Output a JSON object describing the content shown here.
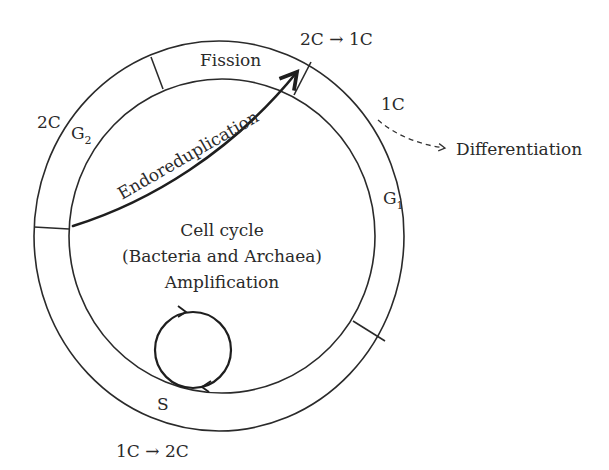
{
  "diagram": {
    "title": "Cell cycle (Bacteria and Archaea)",
    "center_labels": {
      "line1": "Cell cycle",
      "line2": "(Bacteria and Archaea)",
      "line3": "Amplification"
    },
    "phases": {
      "fission": "Fission",
      "g2_main": "G",
      "g2_sub": "2",
      "g1_main": "G",
      "g1_sub": "1",
      "s": "S"
    },
    "ploidy_labels": {
      "g2": "2C",
      "fission_transition": "2C → 1C",
      "g1": "1C",
      "s_transition": "1C → 2C"
    },
    "pathways": {
      "endoreduplication": "Endoreduplication",
      "differentiation": "Differentiation"
    }
  }
}
